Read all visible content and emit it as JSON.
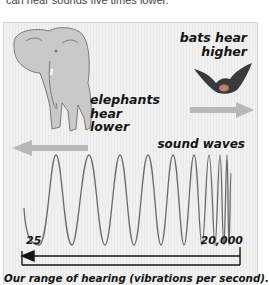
{
  "top_text": "can hear sounds five times lower.",
  "diagram": {
    "bats_label_line1": "bats hear",
    "bats_label_line2": "higher",
    "elephants_label_line1": "elephants",
    "elephants_label_line2": "hear",
    "elephants_label_line3": "lower",
    "waves_label": "sound waves",
    "range_low": "25",
    "range_high": "20,000",
    "caption": "Our range of hearing (vibrations per second).",
    "icons": [
      "elephant-illustration",
      "bat-illustration",
      "arrow-left-icon",
      "arrow-right-icon",
      "range-arrow-icon"
    ],
    "colors": {
      "panel_background": "#eeeeee",
      "wave_stroke": "#6a6a6a",
      "arrow_fill": "#b8b8b8",
      "text": "#141414"
    }
  }
}
